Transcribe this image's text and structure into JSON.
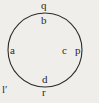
{
  "figure": {
    "type": "circle-diagram",
    "background_color": "#efeeea",
    "stroke_color": "#2b2a28",
    "circle": {
      "center_x": 45,
      "center_y": 50,
      "radius": 37,
      "stroke_width": 1.1
    },
    "labels": {
      "q": "q",
      "b": "b",
      "a": "a",
      "c": "c",
      "p": "p",
      "d": "d",
      "r": "r",
      "l_prime": "l′"
    }
  }
}
